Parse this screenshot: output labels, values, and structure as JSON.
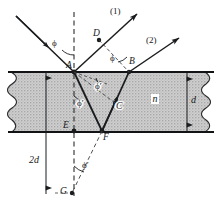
{
  "figure": {
    "medium_label": "n",
    "colors": {
      "line": "#1a1c1e",
      "slab_fill": "#c9c9c9",
      "slab_edge": "#111315",
      "background": "#ffffff"
    }
  },
  "rays": {
    "emergent_1": "(1)",
    "emergent_2": "(2)"
  },
  "points": {
    "A": "A",
    "B": "B",
    "C": "C",
    "D": "D",
    "E": "E",
    "F": "F",
    "G": "G"
  },
  "angles": {
    "phi_incident": "ϕ",
    "phi_at_B": "ϕ",
    "phi_prime_upper": "ϕ′",
    "phi_prime_normal": "ϕ′",
    "phi_prime_below": "ϕ′"
  },
  "dimensions": {
    "thickness": "d",
    "double_thickness": "2d"
  }
}
